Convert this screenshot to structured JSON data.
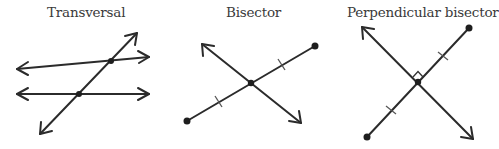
{
  "panels": [
    {
      "title": "Transversal"
    },
    {
      "title": "Bisector"
    },
    {
      "title": "Perpendicular bisector"
    }
  ],
  "colors": {
    "line": "#2b2b2b",
    "text": "#3a3a3a",
    "background": "#ffffff"
  }
}
